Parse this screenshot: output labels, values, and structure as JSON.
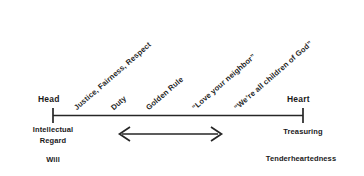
{
  "diagram": {
    "line_color": "#262626",
    "text_color": "#1a1a1a",
    "background": "#ffffff",
    "left_pole": {
      "label": "Head",
      "sub_line_1": "Intellectual",
      "sub_line_2": "Regard",
      "faculty": "Will"
    },
    "right_pole": {
      "label": "Heart",
      "sub_line_1": "Treasuring",
      "faculty": "Tenderheartedness"
    },
    "rungs": [
      {
        "label": "Justice, Fairness, Respect"
      },
      {
        "label": "Duty"
      },
      {
        "label": "Golden Rule"
      },
      {
        "label": "“Love your neighbor”"
      },
      {
        "label": "“We’re all children of God”"
      }
    ],
    "arrow": {
      "name": "bidirectional-arrow",
      "direction": "both"
    }
  }
}
